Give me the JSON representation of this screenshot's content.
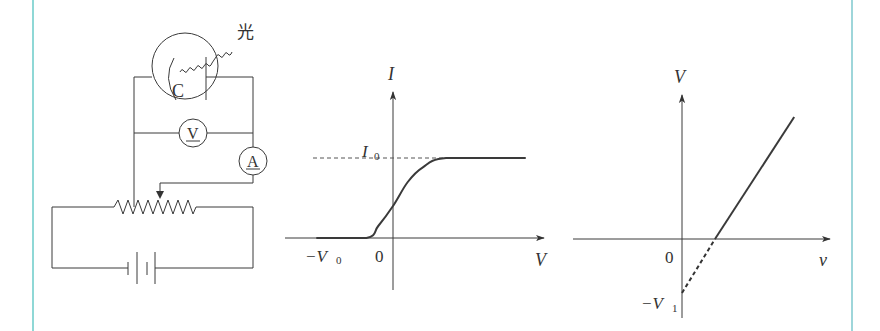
{
  "colors": {
    "frame": "#8fd8d6",
    "ink": "#3a3a3a"
  },
  "circuit": {
    "light_label": "光",
    "cathode_label": "C",
    "voltmeter_label": "V",
    "ammeter_label": "A",
    "components": [
      "phototube",
      "voltmeter",
      "ammeter",
      "rheostat-slider",
      "battery"
    ]
  },
  "chart_data": [
    {
      "type": "line",
      "title": "",
      "xlabel": "V",
      "ylabel": "I",
      "origin_label": "0",
      "annotations": [
        {
          "text": "I",
          "sub": "0",
          "meaning": "saturation current, dashed horizontal reference"
        },
        {
          "text": "−V",
          "sub": "0",
          "meaning": "stopping voltage on negative x-axis"
        }
      ],
      "series": [
        {
          "name": "I-V curve",
          "points_desc": "I = 0 for V ≤ −V0-ish region, rises smoothly through the I axis, saturates at I0",
          "x": [
            -2.6,
            -0.9,
            -0.5,
            0,
            0.5,
            1.0,
            1.8,
            4.5
          ],
          "y": [
            0,
            0,
            0.15,
            0.4,
            0.7,
            0.88,
            1.0,
            1.0
          ]
        }
      ],
      "reference_lines": [
        {
          "axis": "y",
          "value": 1.0,
          "style": "dashed",
          "label": "I0"
        }
      ],
      "xlim": [
        -3.6,
        5.4
      ],
      "ylim": [
        -0.65,
        1.85
      ]
    },
    {
      "type": "line",
      "title": "",
      "xlabel": "ν",
      "ylabel": "V",
      "origin_label": "0",
      "annotations": [
        {
          "text": "−V",
          "sub": "1",
          "meaning": "y-intercept of extrapolated line"
        }
      ],
      "series": [
        {
          "name": "extrapolated",
          "style": "dashed",
          "x": [
            0,
            1
          ],
          "y": [
            -1,
            0
          ]
        },
        {
          "name": "measured",
          "style": "solid",
          "x": [
            1,
            3.4
          ],
          "y": [
            0,
            2.26
          ]
        }
      ],
      "xlim": [
        -3.4,
        4.6
      ],
      "ylim": [
        -1.45,
        2.65
      ]
    }
  ]
}
